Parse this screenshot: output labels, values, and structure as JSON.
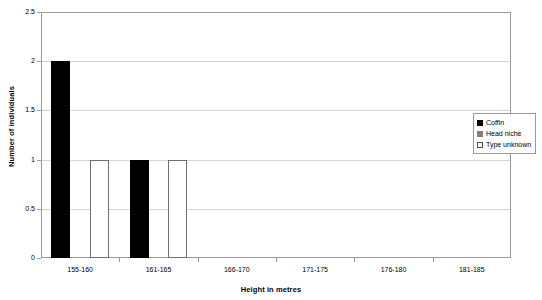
{
  "chart_data": {
    "type": "bar",
    "title": "",
    "xlabel": "Height in metres",
    "ylabel": "Number of individuals",
    "categories": [
      "155-160",
      "161-165",
      "166-170",
      "171-175",
      "176-180",
      "181-185"
    ],
    "series": [
      {
        "name": "Coffin",
        "color": "#000000",
        "values": [
          2,
          1,
          0,
          0,
          0,
          0
        ]
      },
      {
        "name": "Head niche",
        "color": "#808080",
        "values": [
          0,
          0,
          0,
          0,
          0,
          0
        ]
      },
      {
        "name": "Type unknown",
        "color": "#ffffff",
        "values": [
          1,
          1,
          0,
          0,
          0,
          0
        ]
      }
    ],
    "ylim": [
      0,
      2.5
    ],
    "yticks": [
      "0",
      "0.5",
      "1",
      "1.5",
      "2",
      "2.5"
    ],
    "ytick_values": [
      0,
      0.5,
      1,
      1.5,
      2,
      2.5
    ],
    "grid": "horizontal",
    "legend_position": "right-inside"
  },
  "legend": {
    "entries": [
      {
        "label": "Coffin"
      },
      {
        "label": "Head niche"
      },
      {
        "label": "Type unknown"
      }
    ]
  },
  "axes": {
    "y_title": "Number of individuals",
    "x_title": "Height in metres"
  }
}
